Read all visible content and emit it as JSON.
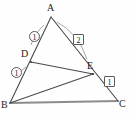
{
  "figure": {
    "stroke_color": "#4a4a4a",
    "arc_color": "#8a8a8a",
    "base_color": "#8c8c8c",
    "label_color": "#1c1c1c",
    "vertices": [
      {
        "id": "A",
        "label": "A",
        "x": 51,
        "y": 17,
        "label_x": 47,
        "label_y": 4
      },
      {
        "id": "B",
        "label": "B",
        "x": 10,
        "y": 103,
        "label_x": 1,
        "label_y": 102
      },
      {
        "id": "C",
        "label": "C",
        "x": 118,
        "y": 101,
        "label_x": 119,
        "label_y": 100
      },
      {
        "id": "D",
        "label": "D",
        "x": 31,
        "y": 62,
        "label_x": 21,
        "label_y": 50
      },
      {
        "id": "E",
        "label": "E",
        "x": 93,
        "y": 74,
        "label_x": 87,
        "label_y": 62
      }
    ],
    "segments": [
      {
        "name": "segment-AB",
        "from": "A",
        "to": "B"
      },
      {
        "name": "segment-AC",
        "from": "A",
        "to": "C"
      },
      {
        "name": "segment-BC",
        "from": "B",
        "to": "C"
      },
      {
        "name": "segment-DE",
        "from": "D",
        "to": "E"
      },
      {
        "name": "segment-BE",
        "from": "B",
        "to": "E"
      }
    ],
    "arcs": [
      {
        "name": "arc-angle-BAD",
        "d": "M 43 24 Q 33 34 31 44"
      },
      {
        "name": "arc-angle-DAE",
        "d": "M 57 22 Q 76 32 86 58"
      },
      {
        "name": "arc-angle-BDE",
        "d": "M 25 66 Q 19 70 17 74"
      }
    ],
    "angle_tags": [
      {
        "name": "angle-tag-1-top-left",
        "value": "1",
        "shape": "circle",
        "x": 29,
        "y": 31
      },
      {
        "name": "angle-tag-2-top-right",
        "value": "2",
        "shape": "square",
        "x": 73,
        "y": 34
      },
      {
        "name": "angle-tag-1-at-d",
        "value": "1",
        "shape": "circle",
        "x": 11,
        "y": 67
      },
      {
        "name": "angle-tag-1-at-e",
        "value": "1",
        "shape": "square",
        "x": 104,
        "y": 76
      }
    ]
  }
}
